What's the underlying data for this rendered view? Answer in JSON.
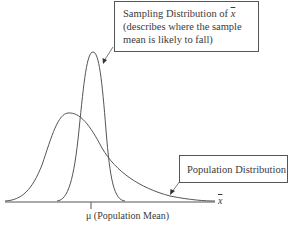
{
  "diagram": {
    "sampling_box": {
      "line1_prefix": "Sampling Distribution of ",
      "line1_symbol": "x",
      "line2": "(describes where the sample",
      "line3": "mean is likely to fall)"
    },
    "population_box": {
      "label": "Population Distribution"
    },
    "axis": {
      "label": "x",
      "label_note": "x-bar"
    },
    "mean_marker": {
      "label": "μ (Population Mean)"
    },
    "colors": {
      "line": "#555555",
      "text": "#3a3a3a",
      "background": "#ffffff"
    },
    "curves": [
      {
        "name": "Sampling Distribution of x-bar",
        "shape": "narrow symmetric, centered at mu"
      },
      {
        "name": "Population Distribution",
        "shape": "wide, right-skewed"
      }
    ]
  }
}
